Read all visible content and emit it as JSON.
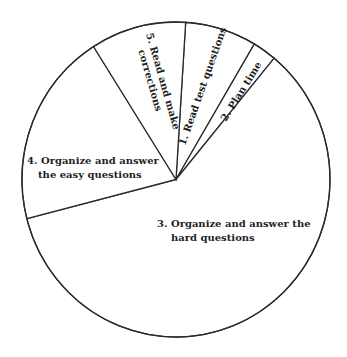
{
  "chart_data": {
    "type": "pie",
    "title": "",
    "start_angle_deg": 3.6,
    "direction": "clockwise",
    "slices": [
      {
        "id": "1",
        "label_lines": [
          "1. Read test questions"
        ],
        "value": 7.5
      },
      {
        "id": "2",
        "label_lines": [
          "2. Plan time"
        ],
        "value": 2.5
      },
      {
        "id": "3",
        "label_lines": [
          "3. Organize and answer the",
          "hard questions"
        ],
        "value": 60
      },
      {
        "id": "4",
        "label_lines": [
          "4. Organize and answer",
          "the easy questions"
        ],
        "value": 20
      },
      {
        "id": "5",
        "label_lines": [
          "5. Read and make",
          "corrections"
        ],
        "value": 10
      }
    ],
    "categories": [
      "1. Read test questions",
      "2. Plan time",
      "3. Organize and answer the hard questions",
      "4. Organize and answer the easy questions",
      "5. Read and make corrections"
    ],
    "values": [
      7.5,
      2.5,
      60,
      20,
      10
    ],
    "unit": "percent of test time (estimated)",
    "legend": "none (labels inside slices)",
    "colors": {
      "fill": "#ffffff",
      "stroke": "#2b2b2b",
      "text": "#1f1f1f"
    }
  }
}
